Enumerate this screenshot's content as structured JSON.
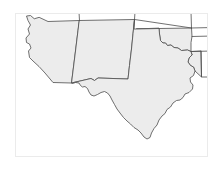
{
  "figure": {
    "title": "Southwestern United States Outline Map",
    "width": 224,
    "height": 170,
    "background_color": "#ffffff",
    "frame_color": "#ebebeb",
    "frame_visible": true
  },
  "map": {
    "projection_note": "plain outline, no labels",
    "land_fill_color": "#ececec",
    "boundary_stroke_color": "#4d4d4d",
    "ocean_fill_color": "#ffffff",
    "boundary_stroke_width": 0.8,
    "has_labels": false,
    "has_legend": false,
    "has_graticule": false,
    "has_scale_bar": false,
    "has_north_arrow": false,
    "region_name": "Southwestern United States"
  },
  "states": [
    {
      "id": "arizona",
      "name": "Arizona",
      "label_visible": false,
      "filled": true,
      "path": "M 38.5 16.5 L 47.0 20.5 L 78.5 19.5 L 77.0 29.5 L 74.5 50.0 L 72.0 70.0 L 70.5 82.0 L 52.0 81.5 L 44.0 72.0 L 38.0 65.5 L 32.0 60.0 L 28.5 56.5 L 27.5 50.0 L 30.0 47.0 L 28.5 43.0 L 25.5 41.5 L 25.0 37.0 L 28.5 33.0 L 27.0 28.0 L 29.5 24.0 L 27.0 19.5 L 25.5 15.0 L 29.5 14.5 L 33.0 17.5 Z"
    },
    {
      "id": "new-mexico",
      "name": "New Mexico",
      "label_visible": false,
      "filled": true,
      "path": "M 78.5 19.5 L 133.5 18.5 L 132.0 33.0 L 130.5 48.0 L 128.5 64.5 L 127.0 78.0 L 97.0 77.0 L 93.5 79.5 L 90.0 77.5 L 70.5 82.0 L 72.0 70.0 L 74.5 50.0 L 77.0 29.5 Z"
    },
    {
      "id": "texas",
      "name": "Texas",
      "label_visible": false,
      "filled": true,
      "path": "M 133.5 18.5 L 133.0 28.0 L 135.5 28.0 L 158.0 27.5 L 158.5 33.0 L 159.5 39.5 L 162.0 42.0 L 164.5 42.0 L 166.5 44.5 L 170.0 44.0 L 173.0 46.5 L 177.0 47.0 L 180.5 49.5 L 186.5 49.0 L 190.0 50.5 L 191.0 54.0 L 188.0 57.0 L 187.0 61.0 L 189.5 64.5 L 192.5 66.0 L 194.0 70.0 L 192.5 74.5 L 189.0 77.0 L 189.5 81.0 L 192.0 84.0 L 191.5 88.0 L 188.0 91.5 L 184.0 93.0 L 182.0 96.5 L 179.0 99.0 L 175.5 99.5 L 172.0 102.0 L 169.5 106.0 L 166.0 108.5 L 164.0 112.5 L 161.0 115.0 L 158.0 119.0 L 156.0 124.0 L 153.0 127.5 L 150.5 132.0 L 149.0 136.5 L 146.0 138.0 L 143.0 136.0 L 140.0 132.0 L 137.0 129.0 L 133.0 126.5 L 129.5 123.0 L 126.0 120.0 L 122.5 116.5 L 119.0 112.0 L 116.0 108.0 L 113.5 103.5 L 111.0 99.0 L 109.0 95.0 L 106.5 92.0 L 103.5 90.5 L 100.0 91.5 L 96.5 93.5 L 93.0 95.0 L 90.0 94.0 L 88.0 91.0 L 86.5 87.5 L 84.0 85.5 L 81.5 86.0 L 79.5 84.5 L 78.0 82.0 L 74.5 81.5 L 71.5 82.5 L 70.5 82.0 L 90.0 77.5 L 93.5 79.5 L 97.0 77.0 L 127.0 78.0 L 128.5 64.5 L 130.5 48.0 L 132.0 33.0 Z"
    },
    {
      "id": "oklahoma",
      "name": "Oklahoma",
      "label_visible": false,
      "filled": true,
      "path": "M 135.5 28.0 L 158.0 27.5 L 190.5 27.0 L 191.0 35.5 L 190.0 41.5 L 190.0 50.5 L 186.5 49.0 L 180.5 49.5 L 177.0 47.0 L 173.0 46.5 L 170.0 44.0 L 166.5 44.5 L 164.5 42.0 L 162.0 42.0 L 159.5 39.5 L 158.5 33.0 L 158.0 27.5 Z"
    },
    {
      "id": "louisiana-west-edge",
      "name": "Louisiana (partial)",
      "label_visible": false,
      "filled": true,
      "path": "M 190.0 50.5 L 200.0 50.0 L 200.5 76.0 L 194.0 70.0 L 192.5 66.0 L 189.5 64.5 L 187.0 61.0 L 188.0 57.0 L 191.0 54.0 Z"
    }
  ],
  "neighbor_boundaries": [
    {
      "id": "utah-colorado-vertical",
      "name": "Utah / Colorado boundary",
      "path": "M 78.5 19.5 L 78.0 11.0"
    },
    {
      "id": "colorado-kansas-vertical",
      "name": "Colorado / Kansas boundary",
      "path": "M 133.5 18.5 L 134.0 11.0"
    },
    {
      "id": "kansas-missouri-vertical",
      "name": "Kansas east boundary",
      "path": "M 190.5 27.0 L 190.0 11.0"
    },
    {
      "id": "southern-state-top-line",
      "name": "Northern state line",
      "path": "M 133.5 18.5 L 190.5 27.0"
    },
    {
      "id": "arkansas-oklahoma-line",
      "name": "Arkansas / Oklahoma boundary",
      "path": "M 191.0 35.5 L 210.0 35.0"
    },
    {
      "id": "arkansas-louisiana-line",
      "name": "Arkansas / Louisiana boundary",
      "path": "M 190.0 50.5 L 210.0 50.0"
    },
    {
      "id": "louisiana-east-line",
      "name": "Louisiana east boundary",
      "path": "M 200.0 50.0 L 200.5 76.0 L 210.0 76.0"
    },
    {
      "id": "kansas-oklahoma-extension",
      "name": "Kansas / Oklahoma boundary east",
      "path": "M 190.5 27.0 L 210.0 26.5"
    }
  ],
  "colors": {
    "land": "#ececec",
    "boundary": "#4d4d4d",
    "frame": "#ebebeb",
    "background": "#ffffff"
  }
}
